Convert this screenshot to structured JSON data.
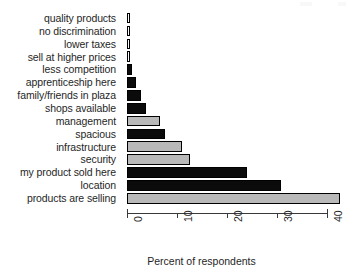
{
  "chart_data": {
    "type": "bar",
    "orientation": "horizontal",
    "title": "",
    "xlabel": "Percent of respondents",
    "ylabel": "",
    "xlim": [
      0,
      42.6
    ],
    "xticks": [
      0,
      10,
      20,
      30,
      40
    ],
    "xtick_labels": [
      "0",
      "10",
      "20",
      "30",
      "40"
    ],
    "grid": false,
    "legend": null,
    "categories": [
      "quality products",
      "no discrimination",
      "lower taxes",
      "sell at higher prices",
      "less competition",
      "apprenticeship here",
      "family/friends in plaza",
      "shops available",
      "management",
      "spacious",
      "infrastructure",
      "security",
      "my product sold here",
      "location",
      "products are selling"
    ],
    "values": [
      0.5,
      0.5,
      0.5,
      0.5,
      1.0,
      1.7,
      2.7,
      3.8,
      6.6,
      7.6,
      11.0,
      12.6,
      24.0,
      30.8,
      42.6
    ],
    "bar_fills": [
      "white",
      "white",
      "white",
      "white",
      "black",
      "black",
      "black",
      "black",
      "gray",
      "black",
      "gray",
      "gray",
      "black",
      "black",
      "gray"
    ],
    "colors": {
      "black": "#0b0b0b",
      "gray": "#b9b9b9",
      "white": "#fbfbfb",
      "outline": "#000000",
      "axis": "#3a3a3a",
      "text": "#1f1f1f",
      "background": "#ffffff"
    }
  }
}
